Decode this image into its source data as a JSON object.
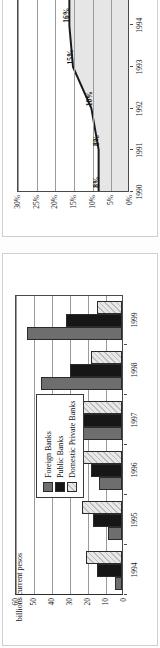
{
  "figure": {
    "charts": [
      {
        "id": "credit-share-chart",
        "type": "area",
        "title": "",
        "xlabel": "",
        "ylabel": "",
        "categories": [
          "1990",
          "1991",
          "1992",
          "1993",
          "1994",
          "1995",
          "1996"
        ],
        "values": [
          8,
          8,
          10,
          15,
          16,
          16,
          18
        ],
        "data_labels": [
          "8%",
          "8%",
          "10%",
          "15%",
          "16%",
          "16%",
          ""
        ],
        "ytick_labels": [
          "0%",
          "5%",
          "10%",
          "15%",
          "20%",
          "25%",
          "30%"
        ],
        "ytick_values": [
          0,
          5,
          10,
          15,
          20,
          25,
          30
        ],
        "ylim": [
          0,
          30
        ],
        "grid": true,
        "legend": "none",
        "rotation": "90-ccw",
        "colors": {
          "area_fill": "#e6e6e6",
          "line": "#1a1a1a",
          "axis": "#4a4a4a"
        }
      },
      {
        "id": "bank-assets-chart",
        "type": "bar",
        "title": "",
        "xlabel": "",
        "ylabel": "billions current pesos",
        "categories": [
          "1994",
          "1995",
          "1996",
          "1997",
          "1998",
          "1999"
        ],
        "series": [
          {
            "name": "Foreign Banks",
            "values": [
              4,
              8,
              13,
              38,
              45,
              53
            ]
          },
          {
            "name": "Public Banks",
            "values": [
              14,
              16,
              17,
              25,
              29,
              31
            ]
          },
          {
            "name": "Domestic Private Banks",
            "values": [
              20,
              22,
              27,
              22,
              17,
              14
            ]
          }
        ],
        "ytick_labels": [
          "0",
          "10",
          "20",
          "30",
          "40",
          "50",
          "60"
        ],
        "ytick_values": [
          0,
          10,
          20,
          30,
          40,
          50,
          60
        ],
        "ylim": [
          0,
          60
        ],
        "grid": true,
        "legend": "inside-upper-left",
        "rotation": "90-ccw",
        "colors": {
          "foreign": "#6e6e6e",
          "public": "#161616",
          "private": "#e8e8e8",
          "axis": "#2d2d2d"
        }
      }
    ]
  }
}
